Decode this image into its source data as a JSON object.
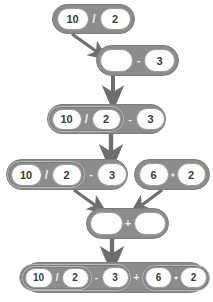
{
  "diagram": {
    "colors": {
      "block_fill": "#8c8c8c",
      "block_stroke": "#7d7d7d",
      "slot_fill": "#fdfdfd",
      "slot_stroke": "#9a9a9a",
      "operator_text": "#efefef",
      "number_text": "#3a3a3a",
      "arrow": "#6e6e6e",
      "background": "#ffffff"
    },
    "steps": [
      {
        "id": "step-1",
        "expression": "10 / 2",
        "tokens": [
          {
            "kind": "number",
            "text": "10"
          },
          {
            "kind": "operator",
            "text": "/"
          },
          {
            "kind": "number",
            "text": "2"
          }
        ]
      },
      {
        "id": "step-2",
        "expression": "_ - 3",
        "tokens": [
          {
            "kind": "empty",
            "text": ""
          },
          {
            "kind": "operator",
            "text": "-"
          },
          {
            "kind": "number",
            "text": "3"
          }
        ]
      },
      {
        "id": "step-3",
        "expression": "10 / 2 - 3",
        "tokens": [
          {
            "kind": "number",
            "text": "10"
          },
          {
            "kind": "operator",
            "text": "/"
          },
          {
            "kind": "number",
            "text": "2"
          },
          {
            "kind": "operator",
            "text": "-"
          },
          {
            "kind": "number",
            "text": "3"
          }
        ]
      },
      {
        "id": "step-4a",
        "expression": "10 / 2 - 3",
        "tokens": [
          {
            "kind": "number",
            "text": "10"
          },
          {
            "kind": "operator",
            "text": "/"
          },
          {
            "kind": "number",
            "text": "2"
          },
          {
            "kind": "operator",
            "text": "-"
          },
          {
            "kind": "number",
            "text": "3"
          }
        ]
      },
      {
        "id": "step-4b",
        "expression": "6 * 2",
        "tokens": [
          {
            "kind": "number",
            "text": "6"
          },
          {
            "kind": "operator-dot",
            "text": "*"
          },
          {
            "kind": "number",
            "text": "2"
          }
        ]
      },
      {
        "id": "step-5",
        "expression": "_ + _",
        "tokens": [
          {
            "kind": "empty",
            "text": ""
          },
          {
            "kind": "operator",
            "text": "+"
          },
          {
            "kind": "empty",
            "text": ""
          }
        ]
      },
      {
        "id": "step-6",
        "expression": "10 / 2 - 3 + 6 * 2",
        "tokens": [
          {
            "kind": "number",
            "text": "10"
          },
          {
            "kind": "operator",
            "text": "/"
          },
          {
            "kind": "number",
            "text": "2"
          },
          {
            "kind": "operator",
            "text": "-"
          },
          {
            "kind": "number",
            "text": "3"
          },
          {
            "kind": "operator",
            "text": "+"
          },
          {
            "kind": "number",
            "text": "6"
          },
          {
            "kind": "operator-dot",
            "text": "*"
          },
          {
            "kind": "number",
            "text": "2"
          }
        ]
      }
    ],
    "arrows": [
      {
        "id": "arrow-1",
        "from": "step-1",
        "to": "step-2",
        "direction": "down-right"
      },
      {
        "id": "arrow-2",
        "from": "step-2",
        "to": "step-3",
        "direction": "down"
      },
      {
        "id": "arrow-3",
        "from": "step-3",
        "to": "step-4a",
        "direction": "down"
      },
      {
        "id": "arrow-4",
        "from": "step-4a",
        "to": "step-5",
        "direction": "down-right"
      },
      {
        "id": "arrow-5",
        "from": "step-4b",
        "to": "step-5",
        "direction": "down-left"
      },
      {
        "id": "arrow-6",
        "from": "step-5",
        "to": "step-6",
        "direction": "down"
      }
    ]
  }
}
